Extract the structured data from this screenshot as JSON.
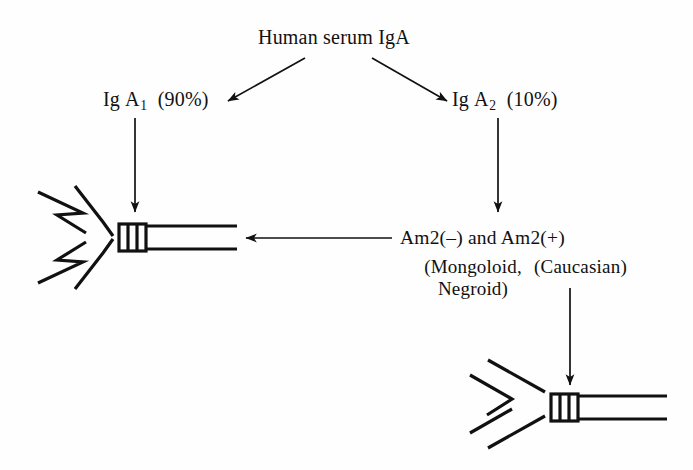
{
  "figure": {
    "background_color": "#fefefe",
    "ink_color": "#111111",
    "title": "Human serum IgA"
  },
  "nodes": {
    "root_label": "Human serum IgA",
    "left_branch": {
      "isotype_prefix": "Ig",
      "isotype_letter": "A",
      "subscript": "1",
      "percent": "(90%)"
    },
    "right_branch": {
      "isotype_prefix": "Ig",
      "isotype_letter": "A",
      "subscript": "2",
      "percent": "(10%)"
    },
    "allotype_line": "Am2(–) and Am2(+)",
    "population_left_line1": "(Mongoloid,",
    "population_left_line2": "Negroid)",
    "population_right": "(Caucasian)"
  },
  "molecules": {
    "upper_left": {
      "name": "iga1-antibody-molecule",
      "fab_style": "zigzag-notched",
      "hinge_bars": 3,
      "orientation": "fc-to-right"
    },
    "lower_right": {
      "name": "iga2-antibody-molecule",
      "fab_style": "smooth-bent",
      "hinge_bars": 3,
      "orientation": "fc-to-right"
    }
  },
  "arrows": [
    {
      "name": "arrow-root-to-iga1",
      "direction": "down-left"
    },
    {
      "name": "arrow-root-to-iga2",
      "direction": "down-right"
    },
    {
      "name": "arrow-iga1-to-molecule",
      "direction": "down"
    },
    {
      "name": "arrow-iga2-to-allotypes",
      "direction": "down"
    },
    {
      "name": "arrow-allotypes-to-iga1-molecule",
      "direction": "left"
    },
    {
      "name": "arrow-caucasian-to-iga2-molecule",
      "direction": "down"
    }
  ]
}
